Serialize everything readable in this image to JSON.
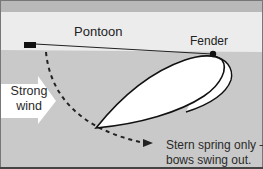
{
  "diagram": {
    "labels": {
      "pontoon": "Pontoon",
      "fender": "Fender",
      "wind_line1": "Strong",
      "wind_line2": "wind",
      "caption_line1": "Stern spring only –",
      "caption_line2": "bows swing out."
    },
    "colors": {
      "top_band": "#b9b9b9",
      "pontoon": "#ececec",
      "water": "#c9c9c9",
      "hull": "#ffffff",
      "outline": "#111111",
      "frame": "#555555",
      "wind_arrow": "#ffffff"
    },
    "elements": [
      "pontoon",
      "cleat",
      "stern-spring-line",
      "fender",
      "boat-hull",
      "wind-arrow",
      "swing-path-arrow"
    ]
  }
}
